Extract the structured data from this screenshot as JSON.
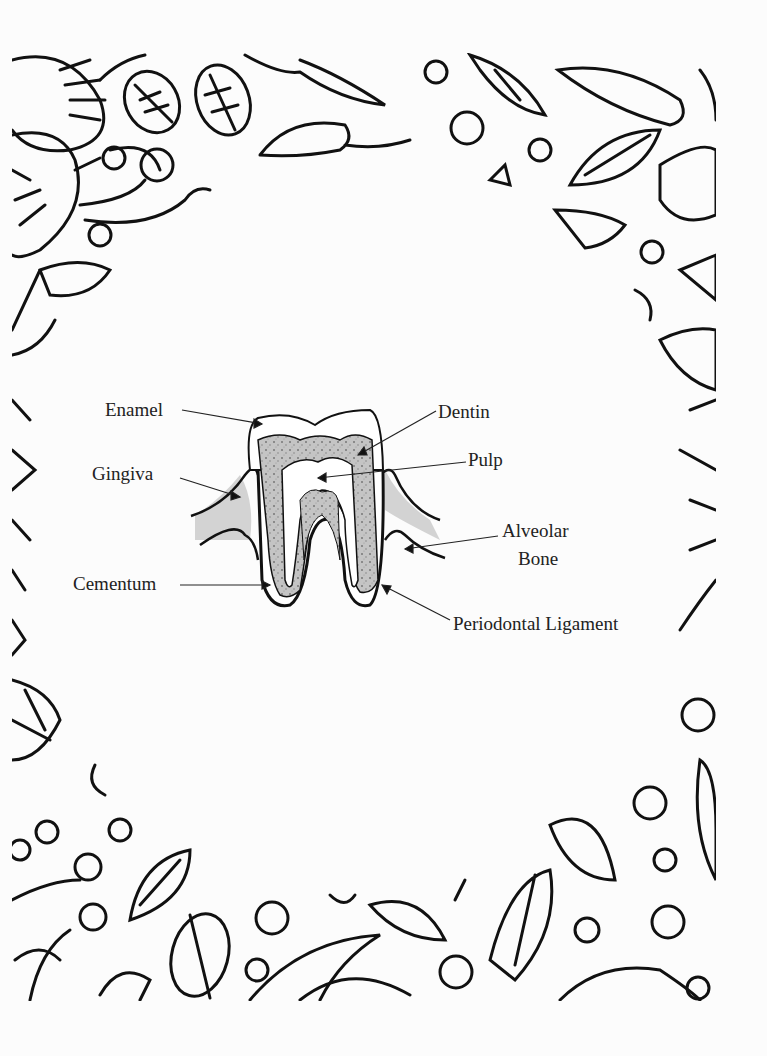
{
  "diagram": {
    "labels": {
      "enamel": "Enamel",
      "dentin": "Dentin",
      "pulp": "Pulp",
      "gingiva": "Gingiva",
      "alveolar_line1": "Alveolar",
      "alveolar_line2": "Bone",
      "cementum": "Cementum",
      "periodontal": "Periodontal Ligament"
    },
    "colors": {
      "line": "#111111",
      "dentin_fill": "#b8b8b8",
      "gum_fill": "#d3d3d3",
      "background": "#ffffff"
    }
  },
  "border": {
    "style": "floral line-art coloring page frame",
    "elements": [
      "flowers",
      "leaves",
      "berries",
      "circles"
    ]
  }
}
